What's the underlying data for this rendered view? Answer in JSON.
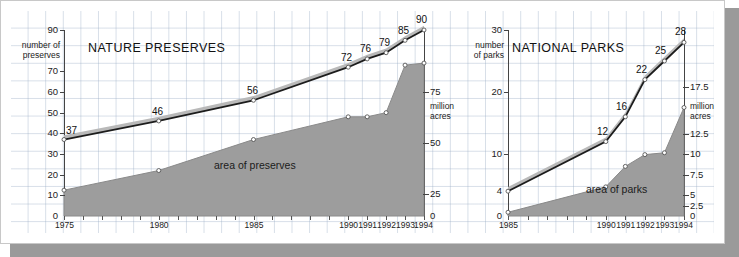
{
  "figure": {
    "background": "#ffffff",
    "grid_color": "#96aac3",
    "area_fill": "#9d9d9d",
    "line_color": "#1c1c1c",
    "ribbon_color": "#b4b4b4"
  },
  "chart_data": [
    {
      "type": "line",
      "title": "NATURE PRESERVES",
      "xlabel": "",
      "ylabel": "number of preserves",
      "y2label": "million acres",
      "x": [
        1975,
        1980,
        1985,
        1990,
        1991,
        1992,
        1993,
        1994
      ],
      "xlim": [
        1975,
        1994
      ],
      "tick_labels_x": [
        "1975",
        "1980",
        "1985",
        "1990",
        "1991",
        "1992",
        "1993",
        "1994"
      ],
      "ylim": [
        0,
        90
      ],
      "tick_labels_y": [
        "90",
        "70",
        "60",
        "50",
        "40",
        "30",
        "20",
        "10",
        "0"
      ],
      "tick_values_y": [
        90,
        70,
        60,
        50,
        40,
        30,
        20,
        10,
        0
      ],
      "y2lim": [
        0,
        90
      ],
      "tick_labels_y2": [
        "75",
        "50",
        "25",
        "0"
      ],
      "tick_values_y2": [
        75,
        50,
        25,
        0
      ],
      "grid": true,
      "legend": "none",
      "series": [
        {
          "name": "number of preserves",
          "axis": "left",
          "render": "ribbon-line",
          "values": [
            37,
            46,
            56,
            72,
            76,
            79,
            85,
            90
          ],
          "point_labels": [
            "37",
            "46",
            "56",
            "72",
            "76",
            "79",
            "85",
            "90"
          ]
        },
        {
          "name": "area of preserves",
          "axis": "right",
          "render": "area",
          "annotation": "area of preserves",
          "values": [
            12.5,
            22,
            37,
            48,
            48,
            50,
            73,
            74
          ]
        }
      ]
    },
    {
      "type": "line",
      "title": "NATIONAL PARKS",
      "xlabel": "",
      "ylabel": "number of parks",
      "y2label": "million acres",
      "x": [
        1985,
        1990,
        1991,
        1992,
        1993,
        1994
      ],
      "xlim": [
        1985,
        1994
      ],
      "tick_labels_x": [
        "1985",
        "1990",
        "1991",
        "1992",
        "1993",
        "1994"
      ],
      "ylim": [
        0,
        30
      ],
      "tick_labels_y": [
        "30",
        "20",
        "10",
        "0"
      ],
      "tick_values_y": [
        30,
        20,
        10,
        0
      ],
      "y2lim": [
        0,
        30
      ],
      "tick_labels_y2": [
        "17.5",
        "12.5",
        "10",
        "7.5",
        "5",
        "2.5",
        "0"
      ],
      "tick_values_y2": [
        17.5,
        12.5,
        10,
        7.5,
        5,
        2.5,
        0
      ],
      "grid": true,
      "legend": "none",
      "series": [
        {
          "name": "number of parks",
          "axis": "left",
          "render": "ribbon-line",
          "values": [
            4,
            12,
            16,
            22,
            25,
            28
          ],
          "point_labels": [
            "4",
            "12",
            "16",
            "22",
            "25",
            "28"
          ]
        },
        {
          "name": "area of parks",
          "axis": "right",
          "render": "area",
          "annotation": "area of parks",
          "values": [
            0.6,
            4.7,
            8.0,
            9.9,
            10.2,
            17.5
          ]
        }
      ]
    }
  ]
}
